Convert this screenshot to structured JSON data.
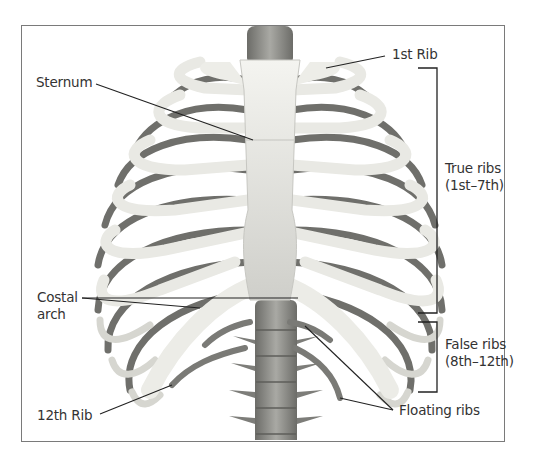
{
  "figure": {
    "labels": {
      "sternum": "Sternum",
      "first_rib": "1st Rib",
      "true_ribs_line1": "True ribs",
      "true_ribs_line2": "(1st–7th)",
      "costal_arch_line1": "Costal",
      "costal_arch_line2": "arch",
      "false_ribs_line1": "False ribs",
      "false_ribs_line2": "(8th–12th)",
      "twelfth_rib": "12th Rib",
      "floating_ribs": "Floating ribs"
    },
    "colors": {
      "bone_light": "#eeeeea",
      "bone_shadow": "#b9b9b4",
      "cartilage": "#d9d9d3",
      "spine": "#8f8f8a",
      "rib_dark": "#6f6f6b",
      "leader_line": "#222222",
      "frame": "#7a7a7a"
    }
  }
}
